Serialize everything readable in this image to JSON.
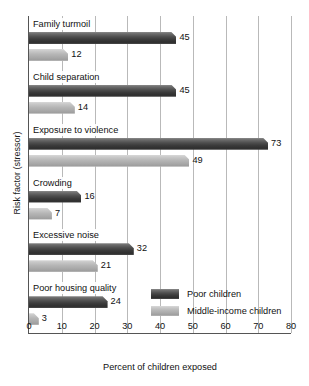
{
  "chart_data": {
    "type": "bar",
    "orientation": "horizontal",
    "title": "",
    "xlabel": "Percent of children exposed",
    "ylabel": "Risk factor (stressor)",
    "xlim": [
      0,
      80
    ],
    "xticks": [
      0,
      10,
      20,
      30,
      40,
      50,
      60,
      70,
      80
    ],
    "xtick_labels": [
      "0",
      "10",
      "20",
      "30",
      "40",
      "50",
      "60",
      "70",
      "80"
    ],
    "grid": "vertical",
    "legend_position": "inside-lower-right",
    "categories": [
      "Family turmoil",
      "Child separation",
      "Exposure to violence",
      "Crowding",
      "Excessive noise",
      "Poor housing quality"
    ],
    "series": [
      {
        "name": "Poor children",
        "color": "#3b3b3b",
        "values": [
          45,
          45,
          73,
          16,
          32,
          24
        ],
        "value_labels": [
          "45",
          "45",
          "73",
          "16",
          "32",
          "24"
        ]
      },
      {
        "name": "Middle-income children",
        "color": "#b6b6b6",
        "values": [
          12,
          14,
          49,
          7,
          21,
          3
        ],
        "value_labels": [
          "12",
          "14",
          "49",
          "7",
          "21",
          "3"
        ]
      }
    ]
  },
  "legend": {
    "items": [
      {
        "label": "Poor children",
        "swatch": "dark"
      },
      {
        "label": "Middle-income children",
        "swatch": "light"
      }
    ]
  }
}
